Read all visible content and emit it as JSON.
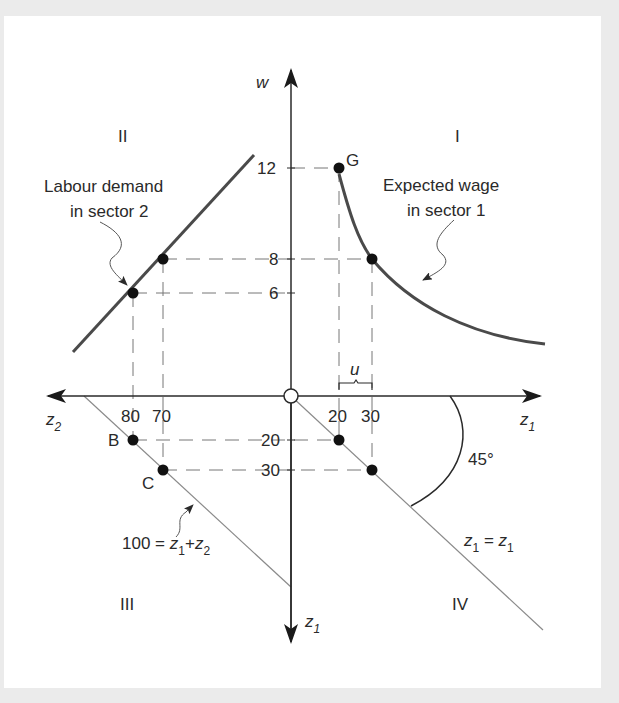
{
  "diagram": {
    "quadrants": {
      "q1": "I",
      "q2": "II",
      "q3": "III",
      "q4": "IV"
    },
    "axes": {
      "vertical_up": "w",
      "vertical_down": "z",
      "vertical_down_sub": "1",
      "horizontal_right": "z",
      "horizontal_right_sub": "1",
      "horizontal_left": "z",
      "horizontal_left_sub": "2"
    },
    "ticks": {
      "w": [
        "12",
        "8",
        "6"
      ],
      "z1_right": [
        "20",
        "30"
      ],
      "z2_left": [
        "80",
        "70"
      ],
      "z1_down": [
        "20",
        "30"
      ]
    },
    "annotations": {
      "labour_demand_line1": "Labour demand",
      "labour_demand_line2": "in sector 2",
      "expected_wage_line1": "Expected wage",
      "expected_wage_line2": "in sector 1",
      "unemployment": "u",
      "angle": "45°",
      "constraint_prefix": "100 = ",
      "constraint_z": "z",
      "constraint_sub1": "1",
      "constraint_plus": "+",
      "constraint_sub2": "2",
      "identity_z": "z",
      "identity_sub": "1",
      "identity_eq": " = "
    },
    "points": {
      "G": "G",
      "B": "B",
      "C": "C"
    },
    "colors": {
      "curve": "#4a4a4a",
      "axis": "#2a2a2a",
      "guide": "#777777",
      "background": "#ebebeb",
      "panel": "#ffffff"
    }
  }
}
